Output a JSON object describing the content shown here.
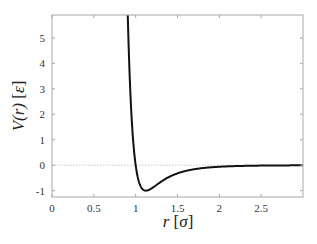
{
  "chart_data": {
    "type": "line",
    "title": "",
    "xlabel": "r [σ]",
    "ylabel": "V(r) [ε]",
    "xlim": [
      0,
      3
    ],
    "ylim": [
      -1.25,
      5.9
    ],
    "x_ticks": [
      0,
      0.5,
      1,
      1.5,
      2,
      2.5
    ],
    "x_tick_labels": [
      "0",
      "0.5",
      "1",
      "1.5",
      "2",
      "2.5"
    ],
    "y_ticks": [
      -1,
      0,
      1,
      2,
      3,
      4,
      5
    ],
    "y_tick_labels": [
      "-1",
      "0",
      "1",
      "2",
      "3",
      "4",
      "5"
    ],
    "grid": false,
    "reference_line": {
      "y": 0,
      "style": "dotted",
      "color": "#bbbbbb"
    },
    "legend": null,
    "series": [
      {
        "name": "Lennard-Jones potential",
        "color": "#111111",
        "x": [
          0.94,
          0.96,
          0.98,
          1.0,
          1.02,
          1.05,
          1.08,
          1.12,
          1.15,
          1.2,
          1.3,
          1.4,
          1.5,
          1.6,
          1.8,
          2.0,
          2.2,
          2.5,
          2.8,
          3.0
        ],
        "values": [
          5.72,
          3.58,
          1.67,
          0.0,
          -0.35,
          -0.72,
          -0.94,
          -1.0,
          -0.98,
          -0.91,
          -0.72,
          -0.52,
          -0.37,
          -0.26,
          -0.13,
          -0.06,
          -0.03,
          -0.02,
          -0.01,
          -0.01
        ]
      }
    ]
  },
  "labels": {
    "xlabel_var": "r",
    "xlabel_unit": "σ",
    "ylabel_var": "V(r)",
    "ylabel_unit": "ε"
  }
}
